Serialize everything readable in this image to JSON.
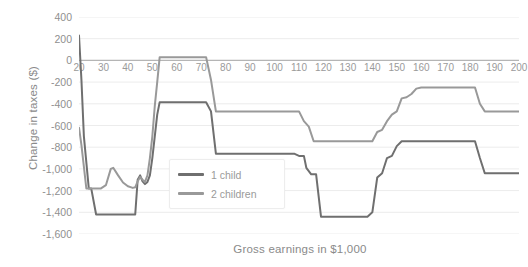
{
  "chart_data": {
    "type": "line",
    "title": "",
    "xlabel": "Gross earnings in $1,000",
    "ylabel": "Change in taxes ($)",
    "xlim": [
      20,
      200
    ],
    "ylim": [
      -1600,
      400
    ],
    "grid": true,
    "legend_position": "center",
    "xticks": [
      20,
      30,
      40,
      50,
      60,
      70,
      80,
      90,
      100,
      110,
      120,
      130,
      140,
      150,
      160,
      170,
      180,
      190,
      200
    ],
    "xtick_labels": [
      "20",
      "30",
      "40",
      "50",
      "60",
      "70",
      "80",
      "90",
      "100",
      "110",
      "120",
      "130",
      "140",
      "150",
      "160",
      "170",
      "180",
      "190",
      "200"
    ],
    "yticks": [
      400,
      200,
      0,
      -200,
      -400,
      -600,
      -800,
      -1000,
      -1200,
      -1400,
      -1600
    ],
    "ytick_labels": [
      "400",
      "200",
      "0",
      "-200",
      "-400",
      "-600",
      "-800",
      "-1,000",
      "-1,200",
      "-1,400",
      "-1,600"
    ],
    "series": [
      {
        "name": "1 child",
        "color": "#6f6f6f",
        "x": [
          20,
          21,
          22,
          24,
          25,
          27,
          28,
          33,
          34,
          36,
          38,
          41,
          42,
          43,
          44,
          45,
          46,
          47,
          48,
          49,
          50,
          52,
          53,
          72,
          74,
          76,
          78,
          105,
          108,
          110,
          112,
          113,
          115,
          117,
          119,
          135,
          138,
          140,
          142,
          144,
          146,
          148,
          150,
          152,
          182,
          184,
          186,
          200
        ],
        "y": [
          230,
          -180,
          -700,
          -1180,
          -1180,
          -1420,
          -1420,
          -1420,
          -1420,
          -1420,
          -1420,
          -1420,
          -1420,
          -1420,
          -1100,
          -1060,
          -1115,
          -1140,
          -1120,
          -1060,
          -900,
          -500,
          -385,
          -385,
          -470,
          -860,
          -860,
          -860,
          -860,
          -880,
          -880,
          -990,
          -1050,
          -1050,
          -1440,
          -1440,
          -1440,
          -1400,
          -1080,
          -1040,
          -900,
          -880,
          -790,
          -745,
          -745,
          -900,
          -1040,
          -1040
        ]
      },
      {
        "name": "2 children",
        "color": "#999999",
        "x": [
          20,
          21,
          23,
          25,
          27,
          29,
          31,
          33,
          34,
          36,
          38,
          40,
          42,
          43,
          44,
          45,
          46,
          47,
          48,
          49,
          50,
          51,
          52,
          53,
          70,
          72,
          74,
          76,
          110,
          112,
          114,
          116,
          140,
          142,
          144,
          146,
          148,
          150,
          152,
          154,
          156,
          158,
          160,
          182,
          184,
          186,
          200
        ],
        "y": [
          -620,
          -780,
          -1180,
          -1180,
          -1180,
          -1180,
          -1150,
          -1000,
          -990,
          -1060,
          -1125,
          -1160,
          -1175,
          -1170,
          -1115,
          -1075,
          -1100,
          -1120,
          -1060,
          -900,
          -700,
          -420,
          -200,
          30,
          30,
          30,
          -180,
          -470,
          -470,
          -560,
          -610,
          -745,
          -745,
          -660,
          -640,
          -560,
          -500,
          -470,
          -350,
          -340,
          -310,
          -260,
          -250,
          -250,
          -400,
          -470,
          -470
        ]
      }
    ]
  },
  "legend": {
    "items": [
      {
        "label": "1 child",
        "color": "#6f6f6f"
      },
      {
        "label": "2 children",
        "color": "#999999"
      }
    ]
  }
}
